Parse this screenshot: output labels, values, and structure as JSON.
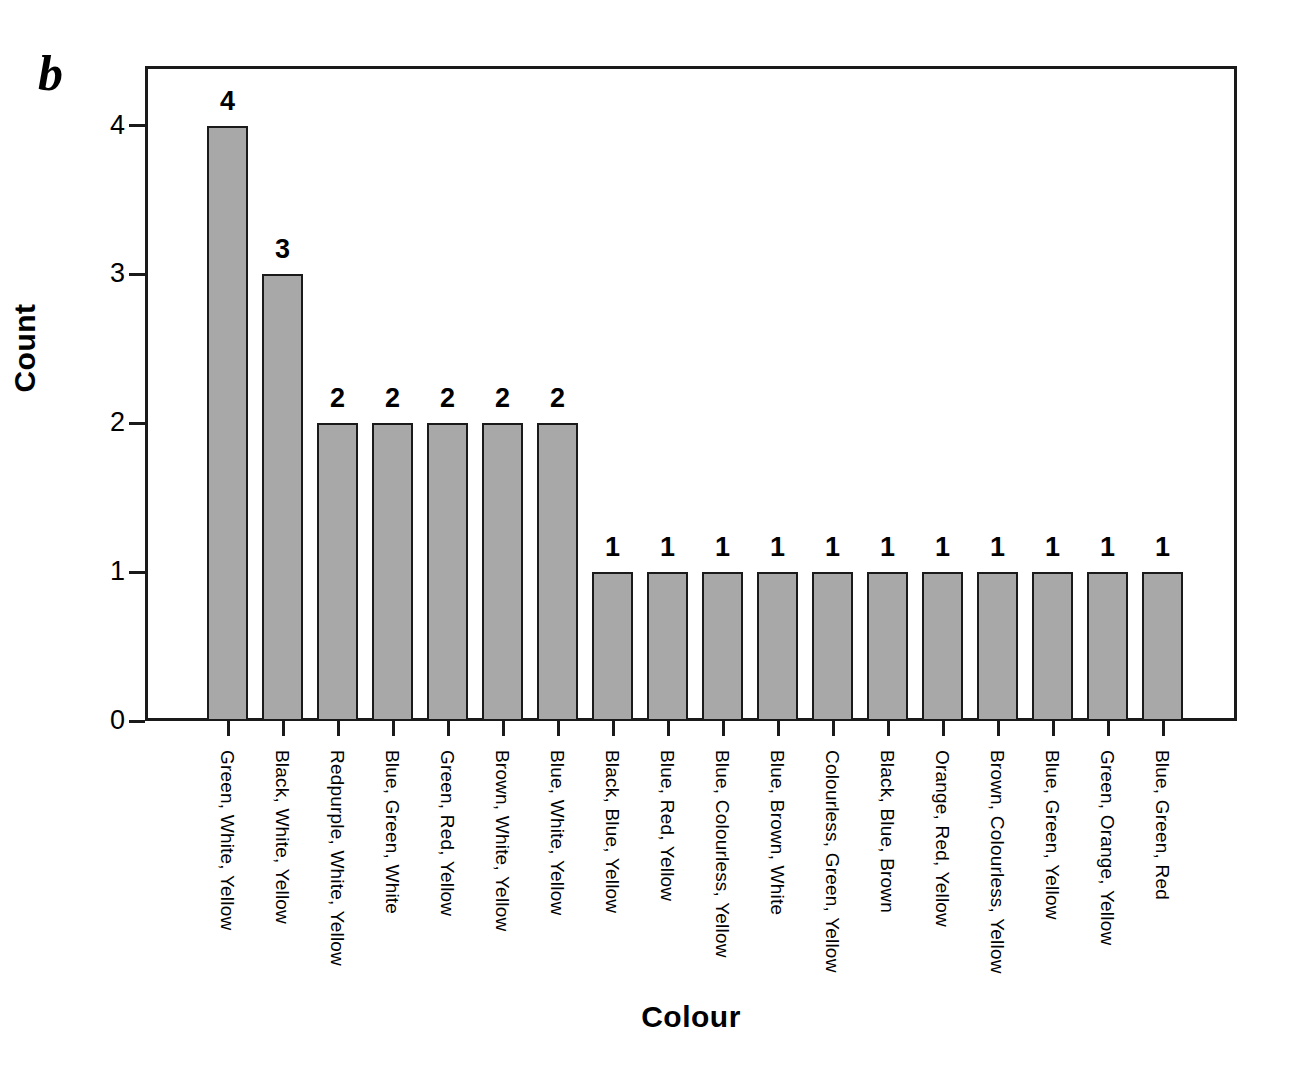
{
  "panel": {
    "letter": "b"
  },
  "chart_data": {
    "type": "bar",
    "title": "",
    "xlabel": "Colour",
    "ylabel": "Count",
    "ylim": [
      0,
      4.4
    ],
    "yticks": [
      0,
      1,
      2,
      3,
      4
    ],
    "ytick_labels": [
      "0",
      "1",
      "2",
      "3",
      "4"
    ],
    "grid": false,
    "legend": null,
    "bar_color": "#a8a8a8",
    "bar_edge_color": "#1a1a1a",
    "show_value_labels": true,
    "categories": [
      "Green, White, Yellow",
      "Black, White, Yellow",
      "Redpurple, White, Yellow",
      "Blue, Green, White",
      "Green, Red, Yellow",
      "Brown, White, Yellow",
      "Blue, White, Yellow",
      "Black, Blue, Yellow",
      "Blue, Red, Yellow",
      "Blue, Colourless, Yellow",
      "Blue, Brown, White",
      "Colourless, Green, Yellow",
      "Black, Blue, Brown",
      "Orange, Red, Yellow",
      "Brown, Colourless, Yellow",
      "Blue, Green, Yellow",
      "Green, Orange, Yellow",
      "Blue, Green, Red"
    ],
    "values": [
      4,
      3,
      2,
      2,
      2,
      2,
      2,
      1,
      1,
      1,
      1,
      1,
      1,
      1,
      1,
      1,
      1,
      1
    ],
    "value_labels": [
      "4",
      "3",
      "2",
      "2",
      "2",
      "2",
      "2",
      "1",
      "1",
      "1",
      "1",
      "1",
      "1",
      "1",
      "1",
      "1",
      "1",
      "1"
    ]
  }
}
